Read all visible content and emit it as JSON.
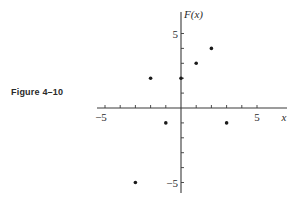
{
  "figure_label": "Figure 4–10",
  "chart_data": {
    "type": "scatter",
    "title": "",
    "xlabel": "x",
    "ylabel": "F(x)",
    "xlim": [
      -6,
      7
    ],
    "ylim": [
      -5.5,
      6
    ],
    "grid": false,
    "x_tick_labels": [
      {
        "value": -5,
        "label": "−5"
      },
      {
        "value": 5,
        "label": "5"
      }
    ],
    "y_tick_labels": [
      {
        "value": 5,
        "label": "5"
      },
      {
        "value": -5,
        "label": "−5"
      }
    ],
    "x_ticks": [
      -5,
      -4,
      -3,
      -2,
      -1,
      1,
      2,
      3,
      4,
      5
    ],
    "y_ticks": [
      -5,
      -4,
      -3,
      -2,
      -1,
      1,
      2,
      3,
      4,
      5
    ],
    "points": [
      {
        "x": -3,
        "y": -5
      },
      {
        "x": -2,
        "y": 2
      },
      {
        "x": -1,
        "y": -1
      },
      {
        "x": 0,
        "y": 2
      },
      {
        "x": 1,
        "y": 3
      },
      {
        "x": 2,
        "y": 4
      },
      {
        "x": 3,
        "y": -1
      }
    ]
  },
  "colors": {
    "axis": "#3a3a3a",
    "point": "#1a1a1a"
  }
}
